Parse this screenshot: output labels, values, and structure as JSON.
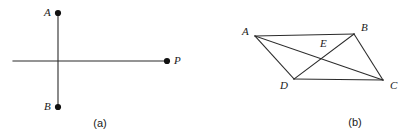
{
  "figure": {
    "background_color": "#ffffff",
    "stroke_color": "#2b2b2b",
    "label_color": "#1a1a1a",
    "panels": [
      {
        "id": "a",
        "caption": "(a)",
        "description": "vertical segment AB crossed by a horizontal line terminating at point P",
        "points": [
          {
            "name": "A",
            "label": "A",
            "x": 58,
            "y": 13,
            "dot": true
          },
          {
            "name": "B",
            "label": "B",
            "x": 58,
            "y": 107,
            "dot": true
          },
          {
            "name": "P",
            "label": "P",
            "x": 167,
            "y": 61,
            "dot": true
          }
        ],
        "segments": [
          {
            "name": "segment-AB",
            "x1": 58,
            "y1": 13,
            "x2": 58,
            "y2": 107
          },
          {
            "name": "line-horizontal-to-P",
            "x1": 13,
            "y1": 61,
            "x2": 167,
            "y2": 61
          }
        ],
        "label_positions": [
          {
            "name": "A",
            "label": "A",
            "x": 44,
            "y": 7
          },
          {
            "name": "B",
            "label": "B",
            "x": 44,
            "y": 101
          },
          {
            "name": "P",
            "label": "P",
            "x": 174,
            "y": 55
          }
        ],
        "caption_x": 100,
        "caption_y": 118
      },
      {
        "id": "b",
        "caption": "(b)",
        "description": "parallelogram ABCD with diagonals AC and BD intersecting at E",
        "points": [
          {
            "name": "A",
            "label": "A",
            "x": 47,
            "y": 36,
            "dot": false
          },
          {
            "name": "B",
            "label": "B",
            "x": 146,
            "y": 34,
            "dot": false
          },
          {
            "name": "C",
            "label": "C",
            "x": 175,
            "y": 80,
            "dot": false
          },
          {
            "name": "D",
            "label": "D",
            "x": 86,
            "y": 79,
            "dot": false
          },
          {
            "name": "E",
            "label": "E",
            "x": 119,
            "y": 57,
            "dot": false
          }
        ],
        "segments": [
          {
            "name": "side-AB",
            "x1": 47,
            "y1": 36,
            "x2": 146,
            "y2": 34
          },
          {
            "name": "side-BC",
            "x1": 146,
            "y1": 34,
            "x2": 175,
            "y2": 80
          },
          {
            "name": "side-CD",
            "x1": 175,
            "y1": 80,
            "x2": 86,
            "y2": 79
          },
          {
            "name": "side-DA",
            "x1": 86,
            "y1": 79,
            "x2": 47,
            "y2": 36
          },
          {
            "name": "diagonal-AC",
            "x1": 47,
            "y1": 36,
            "x2": 175,
            "y2": 80
          },
          {
            "name": "diagonal-BD",
            "x1": 146,
            "y1": 34,
            "x2": 86,
            "y2": 79
          }
        ],
        "label_positions": [
          {
            "name": "A",
            "label": "A",
            "x": 34,
            "y": 26
          },
          {
            "name": "B",
            "label": "B",
            "x": 153,
            "y": 22
          },
          {
            "name": "C",
            "label": "C",
            "x": 182,
            "y": 80
          },
          {
            "name": "D",
            "label": "D",
            "x": 72,
            "y": 80
          },
          {
            "name": "E",
            "label": "E",
            "x": 112,
            "y": 38
          }
        ],
        "caption_x": 147,
        "caption_y": 117
      }
    ]
  }
}
